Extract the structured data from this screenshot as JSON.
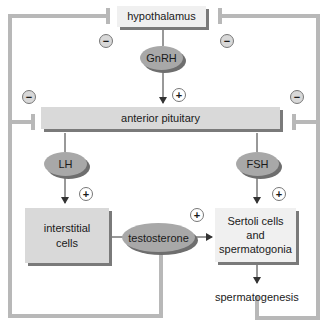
{
  "diagram": {
    "nodes": {
      "hypothalamus": "hypothalamus",
      "gnrh": "GnRH",
      "anterior_pituitary": "anterior pituitary",
      "lh": "LH",
      "fsh": "FSH",
      "interstitial_cells": "interstitial cells",
      "testosterone": "testosterone",
      "sertoli_cells": "Sertoli cells and spermatogonia",
      "spermatogenesis": "spermatogenesis"
    },
    "signs": {
      "plus": "+",
      "minus": "−"
    },
    "edges": [
      {
        "from": "hypothalamus",
        "to": "anterior pituitary",
        "via": "GnRH",
        "sign": "+"
      },
      {
        "from": "anterior pituitary",
        "to": "interstitial cells",
        "via": "LH",
        "sign": "+"
      },
      {
        "from": "anterior pituitary",
        "to": "Sertoli cells and spermatogonia",
        "via": "FSH",
        "sign": "+"
      },
      {
        "from": "interstitial cells",
        "to": "Sertoli cells and spermatogonia",
        "via": "testosterone",
        "sign": "+"
      },
      {
        "from": "Sertoli cells and spermatogonia",
        "to": "spermatogenesis",
        "sign": ""
      },
      {
        "from": "testosterone",
        "to": "hypothalamus",
        "sign": "−",
        "type": "inhibition"
      },
      {
        "from": "testosterone",
        "to": "anterior pituitary",
        "sign": "−",
        "type": "inhibition"
      },
      {
        "from": "spermatogenesis",
        "to": "hypothalamus",
        "sign": "−",
        "type": "inhibition"
      },
      {
        "from": "spermatogenesis",
        "to": "anterior pituitary",
        "sign": "−",
        "type": "inhibition"
      }
    ]
  }
}
